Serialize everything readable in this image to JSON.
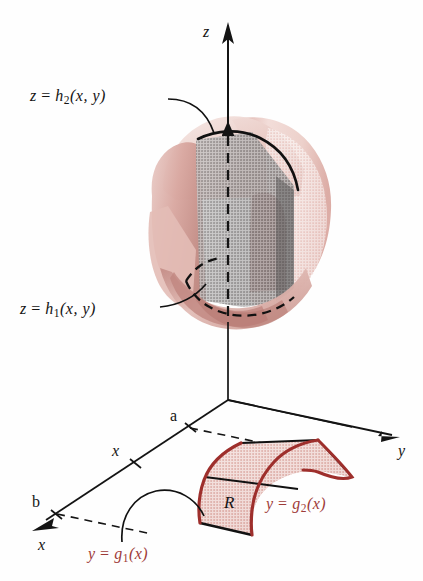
{
  "figure": {
    "background_color": "#fefefe"
  },
  "axes": {
    "z": {
      "label": "z",
      "name": "z-axis"
    },
    "y": {
      "label": "y",
      "name": "y-axis"
    },
    "x": {
      "label": "x",
      "name": "x-axis"
    }
  },
  "ticks": {
    "a": "a",
    "b": "b",
    "x": "x"
  },
  "labels": {
    "upper_surface": {
      "lhs": "z",
      "eq": "=",
      "fn": "h",
      "sub": "2",
      "args": "(x, y)"
    },
    "lower_surface": {
      "lhs": "z",
      "eq": "=",
      "fn": "h",
      "sub": "1",
      "args": "(x, y)"
    },
    "right_boundary": {
      "lhs": "y",
      "eq": "=",
      "fn": "g",
      "sub": "2",
      "args": "(x)"
    },
    "left_boundary": {
      "lhs": "y",
      "eq": "=",
      "fn": "g",
      "sub": "1",
      "args": "(x)"
    },
    "region": "R"
  },
  "colors": {
    "solid_light_pink": "#e7c3bd",
    "solid_pale_pink": "#f0d6d1",
    "solid_mid_rose": "#c48b84",
    "solid_dark_rose": "#9d5c58",
    "slab_gray": "#8b8888",
    "slab_dark_gray": "#6e6b6b",
    "region_fill": "#e4b8b2",
    "boundary_red": "#9e2f2c",
    "label_red": "#9e3b39",
    "ink": "#141414"
  }
}
